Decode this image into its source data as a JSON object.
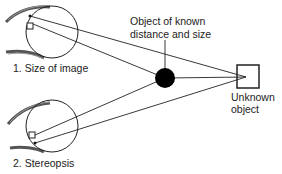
{
  "diagram": {
    "labels": {
      "eye1": "1. Size of image",
      "eye2": "2. Stereopsis",
      "known_object_line1": "Object of known",
      "known_object_line2": "distance and size",
      "unknown_object_line1": "Unknown",
      "unknown_object_line2": "object"
    },
    "colors": {
      "line": "#222222",
      "fill_known": "#000000",
      "background": "#ffffff"
    }
  }
}
